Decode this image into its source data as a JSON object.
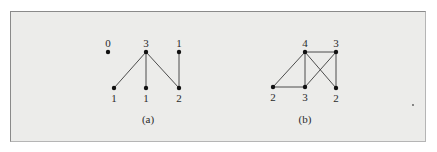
{
  "figure": {
    "colors": {
      "background": "#ececea",
      "frame_border": "#8a8a8a",
      "ink": "#111111"
    },
    "graphs": [
      {
        "caption": "(a)",
        "nodes": [
          {
            "id": "a0",
            "degree": "0",
            "x": 108,
            "y": 52,
            "label_pos": "above"
          },
          {
            "id": "a1",
            "degree": "3",
            "x": 146,
            "y": 52,
            "label_pos": "above"
          },
          {
            "id": "a2",
            "degree": "1",
            "x": 179,
            "y": 52,
            "label_pos": "above"
          },
          {
            "id": "a3",
            "degree": "1",
            "x": 114,
            "y": 88,
            "label_pos": "below"
          },
          {
            "id": "a4",
            "degree": "1",
            "x": 146,
            "y": 88,
            "label_pos": "below"
          },
          {
            "id": "a5",
            "degree": "2",
            "x": 179,
            "y": 88,
            "label_pos": "below"
          }
        ],
        "edges": [
          [
            "a1",
            "a3"
          ],
          [
            "a1",
            "a4"
          ],
          [
            "a1",
            "a5"
          ],
          [
            "a2",
            "a5"
          ]
        ]
      },
      {
        "caption": "(b)",
        "nodes": [
          {
            "id": "b0",
            "degree": "4",
            "x": 305,
            "y": 52,
            "label_pos": "above"
          },
          {
            "id": "b1",
            "degree": "3",
            "x": 336,
            "y": 52,
            "label_pos": "above"
          },
          {
            "id": "b2",
            "degree": "2",
            "x": 273,
            "y": 87,
            "label_pos": "below"
          },
          {
            "id": "b3",
            "degree": "3",
            "x": 305,
            "y": 87,
            "label_pos": "below"
          },
          {
            "id": "b4",
            "degree": "2",
            "x": 336,
            "y": 88,
            "label_pos": "below"
          }
        ],
        "edges": [
          [
            "b0",
            "b1"
          ],
          [
            "b0",
            "b2"
          ],
          [
            "b0",
            "b3"
          ],
          [
            "b0",
            "b4"
          ],
          [
            "b1",
            "b3"
          ],
          [
            "b1",
            "b4"
          ],
          [
            "b2",
            "b3"
          ]
        ]
      }
    ],
    "stray_dot": {
      "x": 413,
      "y": 105
    }
  }
}
